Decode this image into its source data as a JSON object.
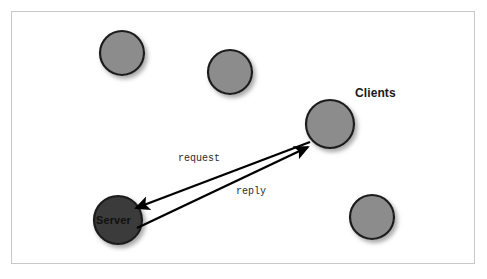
{
  "figure": {
    "kind": "network-diagram",
    "background_color": "#ffffff",
    "frame": {
      "border_color": "#c8c8c8",
      "x": 11,
      "y": 11,
      "width": 464,
      "height": 253
    }
  },
  "colors": {
    "client_fill": "#8c8c8c",
    "client_stroke": "#1a1a1a",
    "server_fill": "#3b3b3b",
    "server_stroke": "#1a1a1a",
    "arrow": "#000000",
    "shadow": "#b5b5b5",
    "label_text": "#1a1a1a",
    "edge_label_text": "#2b2b2b"
  },
  "nodes": [
    {
      "id": "client-1",
      "role": "client",
      "label": "",
      "cx": 122,
      "cy": 53,
      "r": 22
    },
    {
      "id": "client-2",
      "role": "client",
      "label": "",
      "cx": 230,
      "cy": 72,
      "r": 22
    },
    {
      "id": "client-3",
      "role": "client",
      "label": "Clients",
      "cx": 330,
      "cy": 124,
      "r": 24
    },
    {
      "id": "client-4",
      "role": "client",
      "label": "",
      "cx": 372,
      "cy": 217,
      "r": 22
    },
    {
      "id": "server-1",
      "role": "server",
      "label": "Server",
      "cx": 118,
      "cy": 220,
      "r": 24
    }
  ],
  "labels": {
    "clients": "Clients",
    "server": "Server"
  },
  "edges": [
    {
      "id": "request",
      "label": "request",
      "from": "client-3",
      "to": "server-1",
      "direction": "client-to-server",
      "x1": 310,
      "y1": 142,
      "x2": 133,
      "y2": 210
    },
    {
      "id": "reply",
      "label": "reply",
      "from": "server-1",
      "to": "client-3",
      "direction": "server-to-client",
      "x1": 137,
      "y1": 228,
      "x2": 311,
      "y2": 145
    }
  ]
}
